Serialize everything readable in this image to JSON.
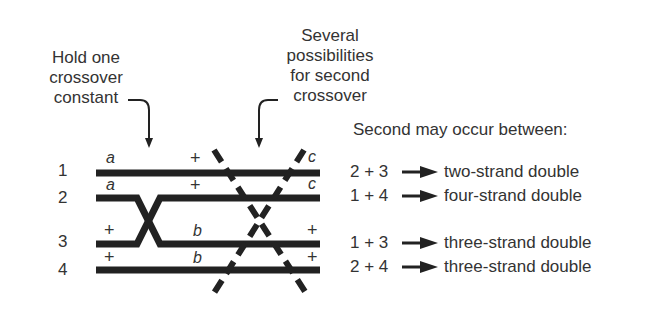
{
  "captions": {
    "hold": [
      "Hold one",
      "crossover",
      "constant"
    ],
    "several": [
      "Several",
      "possibilities",
      "for second",
      "crossover"
    ]
  },
  "strands": [
    {
      "number": "1",
      "left": "a",
      "middle": "+",
      "right": "c"
    },
    {
      "number": "2",
      "left": "a",
      "middle": "+",
      "right": "c"
    },
    {
      "number": "3",
      "left": "+",
      "middle": "b",
      "right": "+"
    },
    {
      "number": "4",
      "left": "+",
      "middle": "b",
      "right": "+"
    }
  ],
  "legend": {
    "title": "Second may occur between:",
    "rows": [
      {
        "pair": "2 + 3",
        "result": "two-strand double"
      },
      {
        "pair": "1 + 4",
        "result": "four-strand double"
      },
      {
        "pair": "1 + 3",
        "result": "three-strand double"
      },
      {
        "pair": "2 + 4",
        "result": "three-strand double"
      }
    ]
  },
  "colors": {
    "ink": "#222222",
    "text": "#333333",
    "background": "#ffffff"
  }
}
